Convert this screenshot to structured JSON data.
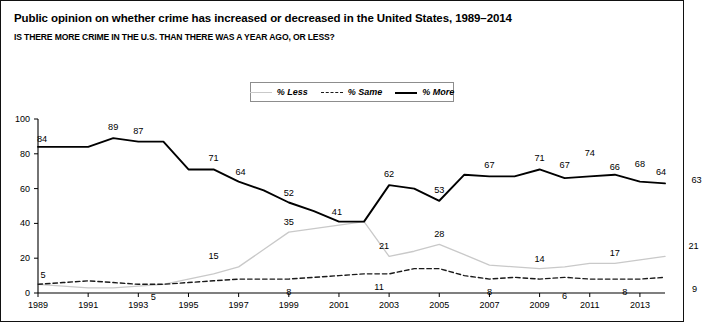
{
  "title": "Public opinion on whether crime has increased or decreased in the United States, 1989–2014",
  "subtitle": "IS THERE MORE CRIME IN THE U.S. THAN THERE WAS A YEAR AGO, OR LESS?",
  "legend": {
    "items": [
      {
        "label": "% Less",
        "style": "solid-light-gray",
        "color": "#c9c9c9"
      },
      {
        "label": "% Same",
        "style": "dashed-black",
        "color": "#1a1a1a"
      },
      {
        "label": "% More",
        "style": "solid-black-thick",
        "color": "#000000"
      }
    ],
    "position": "top-center"
  },
  "chart_data": {
    "type": "line",
    "title": "Public opinion on whether crime has increased or decreased in the United States, 1989–2014",
    "subtitle": "IS THERE MORE CRIME IN THE U.S. THAN THERE WAS A YEAR AGO, OR LESS?",
    "xlabel": "",
    "ylabel": "",
    "xlim": [
      1989,
      2014
    ],
    "ylim": [
      0,
      100
    ],
    "yticks": [
      0,
      20,
      40,
      60,
      80,
      100
    ],
    "xticks": [
      1989,
      1991,
      1993,
      1995,
      1997,
      1999,
      2001,
      2003,
      2005,
      2007,
      2009,
      2011,
      2013
    ],
    "grid": false,
    "legend_position": "top-center",
    "x": [
      1989,
      1990,
      1991,
      1992,
      1993,
      1994,
      1995,
      1996,
      1997,
      1998,
      1999,
      2000,
      2001,
      2002,
      2003,
      2004,
      2005,
      2006,
      2007,
      2008,
      2009,
      2010,
      2011,
      2012,
      2013,
      2014
    ],
    "series": [
      {
        "name": "% More",
        "color": "#000000",
        "values": [
          84,
          84,
          84,
          89,
          87,
          87,
          71,
          71,
          64,
          59,
          52,
          47,
          41,
          41,
          62,
          60,
          53,
          68,
          67,
          67,
          71,
          66,
          67,
          68,
          64,
          63
        ]
      },
      {
        "name": "% Same",
        "color": "#1a1a1a",
        "values": [
          5,
          6,
          7,
          6,
          5,
          5,
          6,
          7,
          8,
          8,
          8,
          9,
          10,
          11,
          11,
          14,
          14,
          10,
          8,
          9,
          8,
          9,
          8,
          8,
          8,
          9
        ]
      },
      {
        "name": "% Less",
        "color": "#c9c9c9",
        "values": [
          5,
          4,
          3,
          3,
          4,
          5,
          8,
          11,
          15,
          25,
          35,
          37,
          39,
          41,
          21,
          24,
          28,
          22,
          16,
          15,
          14,
          15,
          17,
          17,
          19,
          21
        ]
      }
    ],
    "point_labels": [
      {
        "series": "% More",
        "year": 1989,
        "value": 84
      },
      {
        "series": "% More",
        "year": 1992,
        "value": 89
      },
      {
        "series": "% More",
        "year": 1993,
        "value": 87
      },
      {
        "series": "% More",
        "year": 1996,
        "value": 71
      },
      {
        "series": "% More",
        "year": 1997,
        "value": 64
      },
      {
        "series": "% More",
        "year": 1999,
        "value": 52
      },
      {
        "series": "% More",
        "year": 2001,
        "value": 41
      },
      {
        "series": "% More",
        "year": 2003,
        "value": 62
      },
      {
        "series": "% More",
        "year": 2005,
        "value": 53
      },
      {
        "series": "% More",
        "year": 2007,
        "value": 67
      },
      {
        "series": "% More",
        "year": 2009,
        "value": 71
      },
      {
        "series": "% More",
        "year": 2010,
        "value": 67
      },
      {
        "series": "% More",
        "year": 2011,
        "value": 74
      },
      {
        "series": "% More",
        "year": 2012,
        "value": 66
      },
      {
        "series": "% More",
        "year": 2013,
        "value": 68
      },
      {
        "series": "% More",
        "year": 2014,
        "value": 64
      },
      {
        "series": "% More",
        "year": 2014.9,
        "value": 63
      },
      {
        "series": "% Less",
        "year": 1996,
        "value": 15
      },
      {
        "series": "% Less",
        "year": 1999,
        "value": 35
      },
      {
        "series": "% Less",
        "year": 2003,
        "value": 21
      },
      {
        "series": "% Less",
        "year": 2005,
        "value": 28
      },
      {
        "series": "% Less",
        "year": 2009,
        "value": 14
      },
      {
        "series": "% Less",
        "year": 2012,
        "value": 17
      },
      {
        "series": "% Less",
        "year": 2014.9,
        "value": 21
      },
      {
        "series": "% Same",
        "year": 1989,
        "value": 5
      },
      {
        "series": "% Same",
        "year": 1993.6,
        "value": 5
      },
      {
        "series": "% Same",
        "year": 1999,
        "value": 8
      },
      {
        "series": "% Same",
        "year": 2002.6,
        "value": 11
      },
      {
        "series": "% Same",
        "year": 2007,
        "value": 8
      },
      {
        "series": "% Same",
        "year": 2010,
        "value": 6
      },
      {
        "series": "% Same",
        "year": 2012.4,
        "value": 8
      },
      {
        "series": "% Same",
        "year": 2014.9,
        "value": 9
      }
    ]
  },
  "axis": {
    "y_ticks": [
      "0",
      "20",
      "40",
      "60",
      "80",
      "100"
    ],
    "x_ticks": [
      "1989",
      "1991",
      "1993",
      "1995",
      "1997",
      "1999",
      "2001",
      "2003",
      "2005",
      "2007",
      "2009",
      "2011",
      "2013"
    ]
  }
}
